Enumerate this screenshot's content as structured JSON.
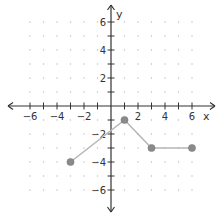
{
  "chart_data": {
    "type": "line",
    "title": "",
    "xlabel": "x",
    "ylabel": "y",
    "xlim": [
      -6,
      6
    ],
    "ylim": [
      -6,
      6
    ],
    "grid": "dots",
    "x_ticks": [
      -6,
      -4,
      -2,
      2,
      4,
      6
    ],
    "y_ticks": [
      6,
      4,
      2,
      -2,
      -4,
      -6
    ],
    "series": [
      {
        "name": "piecewise",
        "points": [
          [
            -3,
            -4
          ],
          [
            1,
            -1
          ],
          [
            3,
            -3
          ],
          [
            6,
            -3
          ]
        ],
        "endpoints": "closed"
      }
    ],
    "colors": {
      "axis": "#333333",
      "line": "#b5b5b5",
      "point": "#8a8a8a",
      "grid_dot": "#bbbbbb"
    }
  }
}
